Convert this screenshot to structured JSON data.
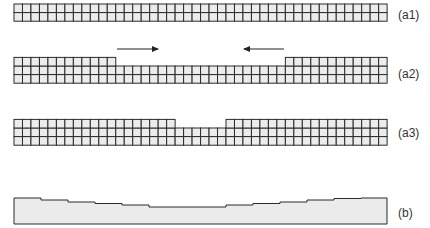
{
  "panels": [
    {
      "id": "a1",
      "label": "(a1)"
    },
    {
      "id": "a2",
      "label": "(a2)"
    },
    {
      "id": "a3",
      "label": "(a3)"
    },
    {
      "id": "b",
      "label": "(b)"
    }
  ],
  "colors": {
    "cell_fill": "#ececec",
    "grid_line": "#2b2b2b",
    "profile_fill": "#ebebeb",
    "profile_line": "#2b2b2b",
    "arrow": "#222222",
    "label": "#333333"
  },
  "grid": {
    "x0": 14,
    "cols": 44,
    "cell_w": 8.48,
    "cell_h": 8.6
  },
  "a1": {
    "top": 4,
    "rows": 2
  },
  "a2": {
    "base_top": 66,
    "base_rows": 2,
    "left_block_cols": 12,
    "right_block_cols": 12,
    "block_extra_rows": 1,
    "arrows": [
      {
        "x1": 117,
        "x2": 158,
        "y": 49,
        "direction": "right"
      },
      {
        "x1": 284,
        "x2": 244,
        "y": 49,
        "direction": "left"
      }
    ]
  },
  "a3": {
    "base_top": 128,
    "base_rows": 2,
    "left_block_cols": 19,
    "right_block_cols": 19,
    "block_extra_rows": 1
  },
  "b": {
    "bottom": 224,
    "x_start": 14,
    "x_end": 387,
    "step_xs": [
      14,
      41,
      68,
      95,
      122,
      149,
      176,
      226,
      253,
      280,
      307,
      334,
      361,
      387
    ],
    "step_ys": [
      198,
      200,
      202,
      203.5,
      205,
      207,
      207,
      205,
      203.5,
      202,
      200,
      198.5,
      198
    ]
  }
}
